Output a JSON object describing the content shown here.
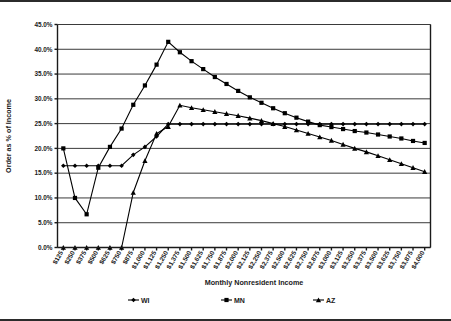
{
  "chart_data": {
    "type": "line",
    "title": "",
    "xlabel": "Monthly Nonresident Income",
    "ylabel": "Order as % of Income",
    "ylim": [
      0,
      45
    ],
    "ytick_labels": [
      "0.0%",
      "5.0%",
      "10.0%",
      "15.0%",
      "20.0%",
      "25.0%",
      "30.0%",
      "35.0%",
      "40.0%",
      "45.0%"
    ],
    "ytick_values": [
      0,
      5,
      10,
      15,
      20,
      25,
      30,
      35,
      40,
      45
    ],
    "grid": true,
    "legend_position": "bottom",
    "categories": [
      "$125",
      "$250",
      "$375",
      "$500",
      "$625",
      "$750",
      "$875",
      "$1,000",
      "$1,125",
      "$1,250",
      "$1,375",
      "$1,500",
      "$1,625",
      "$1,750",
      "$1,875",
      "$2,000",
      "$2,125",
      "$2,250",
      "$2,375",
      "$2,500",
      "$2,625",
      "$2,750",
      "$2,875",
      "$3,000",
      "$3,125",
      "$3,250",
      "$3,375",
      "$3,500",
      "$3,625",
      "$3,750",
      "$3,875",
      "$4,000"
    ],
    "series": [
      {
        "name": "WI",
        "marker": "diamond",
        "values": [
          16.5,
          16.5,
          16.5,
          16.5,
          16.5,
          16.5,
          18.7,
          20.3,
          22.4,
          24.9,
          24.9,
          24.9,
          24.9,
          24.9,
          24.9,
          24.9,
          24.9,
          24.9,
          24.9,
          24.9,
          24.9,
          24.9,
          24.9,
          24.9,
          24.9,
          24.9,
          24.9,
          24.9,
          24.9,
          24.9,
          24.9,
          24.9
        ]
      },
      {
        "name": "MN",
        "marker": "square",
        "values": [
          20.0,
          10.0,
          6.7,
          16.1,
          20.3,
          24.0,
          28.8,
          32.7,
          36.9,
          41.5,
          39.4,
          37.6,
          36.0,
          34.4,
          33.0,
          31.6,
          30.3,
          29.2,
          28.1,
          27.1,
          26.2,
          25.4,
          24.7,
          24.3,
          23.9,
          23.5,
          23.2,
          22.8,
          22.4,
          22.0,
          21.5,
          21.1
        ]
      },
      {
        "name": "AZ",
        "marker": "triangle",
        "values": [
          0.0,
          0.0,
          0.0,
          0.0,
          0.0,
          0.0,
          11.1,
          17.5,
          23.0,
          24.4,
          28.7,
          28.2,
          27.8,
          27.4,
          27.0,
          26.6,
          26.1,
          25.6,
          25.0,
          24.4,
          23.7,
          23.0,
          22.3,
          21.6,
          20.8,
          20.0,
          19.3,
          18.5,
          17.7,
          16.9,
          16.1,
          15.3
        ]
      }
    ]
  },
  "legend": {
    "items": [
      {
        "label": "WI",
        "marker": "diamond"
      },
      {
        "label": "MN",
        "marker": "square"
      },
      {
        "label": "AZ",
        "marker": "triangle"
      }
    ]
  }
}
